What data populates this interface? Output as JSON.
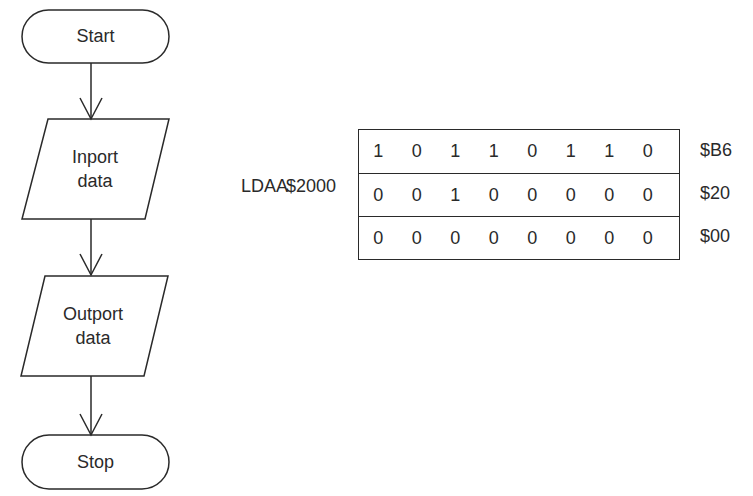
{
  "flowchart": {
    "nodes": [
      {
        "id": "start",
        "type": "terminator",
        "label": "Start"
      },
      {
        "id": "inport",
        "type": "io",
        "label_lines": [
          "Inport",
          "data"
        ]
      },
      {
        "id": "outport",
        "type": "io",
        "label_lines": [
          "Outport",
          "data"
        ]
      },
      {
        "id": "stop",
        "type": "terminator",
        "label": "Stop"
      }
    ],
    "edges": [
      {
        "from": "start",
        "to": "inport"
      },
      {
        "from": "inport",
        "to": "outport"
      },
      {
        "from": "outport",
        "to": "stop"
      }
    ]
  },
  "instruction": {
    "mnemonic": "LDAA",
    "operand": "$2000"
  },
  "memory": {
    "rows": [
      {
        "bits": [
          "1",
          "0",
          "1",
          "1",
          "0",
          "1",
          "1",
          "0"
        ],
        "hex": "$B6"
      },
      {
        "bits": [
          "0",
          "0",
          "1",
          "0",
          "0",
          "0",
          "0",
          "0"
        ],
        "hex": "$20"
      },
      {
        "bits": [
          "0",
          "0",
          "0",
          "0",
          "0",
          "0",
          "0",
          "0"
        ],
        "hex": "$00"
      }
    ]
  },
  "colors": {
    "stroke": "#2a2a2a",
    "background": "#ffffff"
  }
}
